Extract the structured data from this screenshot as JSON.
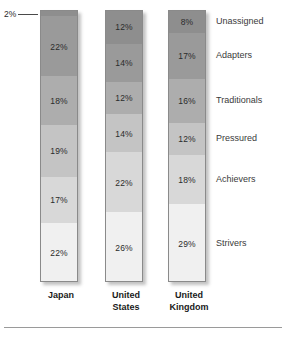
{
  "chart_data": {
    "type": "bar",
    "subtype": "stacked-100-percent",
    "title": "",
    "subtitle": "",
    "xlabel": "",
    "ylabel": "",
    "ylim": [
      0,
      100
    ],
    "grid": false,
    "legend_position": "right-labels",
    "categories": [
      "Japan",
      "United States",
      "United Kingdom"
    ],
    "series": [
      {
        "name": "Unassigned",
        "values": [
          2,
          12,
          8
        ]
      },
      {
        "name": "Adapters",
        "values": [
          22,
          14,
          17
        ]
      },
      {
        "name": "Traditionals",
        "values": [
          18,
          12,
          16
        ]
      },
      {
        "name": "Pressured",
        "values": [
          19,
          14,
          12
        ]
      },
      {
        "name": "Achievers",
        "values": [
          17,
          22,
          18
        ]
      },
      {
        "name": "Strivers",
        "values": [
          22,
          26,
          29
        ]
      }
    ],
    "value_suffix": "%",
    "annotations": [
      {
        "text": "2%",
        "target_series": "Unassigned",
        "target_category": "Japan"
      }
    ],
    "colors": {
      "Unassigned": "#8e8e8e",
      "Adapters": "#9a9a9a",
      "Traditionals": "#adadad",
      "Pressured": "#c4c4c4",
      "Achievers": "#d8d8d8",
      "Strivers": "#f0f0f0",
      "border": "#8a8a8a",
      "text": "#2b2b2b",
      "label_text": "#3a3a3a",
      "rule": "#9a9a9a",
      "background": "#ffffff"
    }
  },
  "bars": [
    {
      "country_line1": "Japan",
      "country_line2": "",
      "segments": [
        {
          "label": "Unassigned",
          "value": "2%",
          "pct": 2,
          "show_label": false
        },
        {
          "label": "Adapters",
          "value": "22%",
          "pct": 22,
          "show_label": true
        },
        {
          "label": "Traditionals",
          "value": "18%",
          "pct": 18,
          "show_label": true
        },
        {
          "label": "Pressured",
          "value": "19%",
          "pct": 19,
          "show_label": true
        },
        {
          "label": "Achievers",
          "value": "17%",
          "pct": 17,
          "show_label": true
        },
        {
          "label": "Strivers",
          "value": "22%",
          "pct": 22,
          "show_label": true
        }
      ]
    },
    {
      "country_line1": "United",
      "country_line2": "States",
      "segments": [
        {
          "label": "Unassigned",
          "value": "12%",
          "pct": 12,
          "show_label": true
        },
        {
          "label": "Adapters",
          "value": "14%",
          "pct": 14,
          "show_label": true
        },
        {
          "label": "Traditionals",
          "value": "12%",
          "pct": 12,
          "show_label": true
        },
        {
          "label": "Pressured",
          "value": "14%",
          "pct": 14,
          "show_label": true
        },
        {
          "label": "Achievers",
          "value": "22%",
          "pct": 22,
          "show_label": true
        },
        {
          "label": "Strivers",
          "value": "26%",
          "pct": 26,
          "show_label": true
        }
      ]
    },
    {
      "country_line1": "United",
      "country_line2": "Kingdom",
      "segments": [
        {
          "label": "Unassigned",
          "value": "8%",
          "pct": 8,
          "show_label": true
        },
        {
          "label": "Adapters",
          "value": "17%",
          "pct": 17,
          "show_label": true
        },
        {
          "label": "Traditionals",
          "value": "16%",
          "pct": 16,
          "show_label": true
        },
        {
          "label": "Pressured",
          "value": "12%",
          "pct": 12,
          "show_label": true
        },
        {
          "label": "Achievers",
          "value": "18%",
          "pct": 18,
          "show_label": true
        },
        {
          "label": "Strivers",
          "value": "29%",
          "pct": 29,
          "show_label": true
        }
      ]
    }
  ],
  "category_labels": [
    "Unassigned",
    "Adapters",
    "Traditionals",
    "Pressured",
    "Achievers",
    "Strivers"
  ],
  "callout": {
    "text": "2%"
  }
}
